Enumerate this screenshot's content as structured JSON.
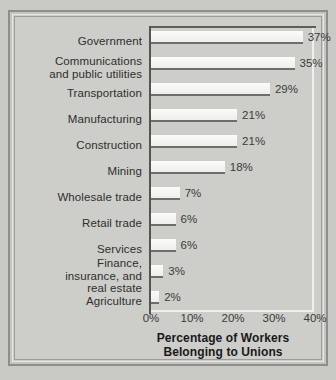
{
  "chart_data": {
    "type": "bar",
    "orientation": "horizontal",
    "title": "Percentage of Workers Belonging to Unions",
    "title_line1": "Percentage of Workers",
    "title_line2": "Belonging to Unions",
    "xlabel": "",
    "ylabel": "",
    "xlim": [
      0,
      40
    ],
    "grid": false,
    "legend": "none",
    "xticks": [
      "0%",
      "10%",
      "20%",
      "30%",
      "40%"
    ],
    "xtick_values": [
      0,
      10,
      20,
      30,
      40
    ],
    "categories": [
      "Government",
      "Communications and public utilities",
      "Transportation",
      "Manufacturing",
      "Construction",
      "Mining",
      "Wholesale trade",
      "Retail trade",
      "Services",
      "Finance, insurance, and real estate",
      "Agriculture"
    ],
    "values": [
      37,
      35,
      29,
      21,
      21,
      18,
      7,
      6,
      6,
      3,
      2
    ],
    "value_labels": [
      "37%",
      "35%",
      "29%",
      "21%",
      "21%",
      "18%",
      "7%",
      "6%",
      "6%",
      "3%",
      "2%"
    ],
    "bars": [
      {
        "label_lines": [
          "Government"
        ],
        "value": 37,
        "value_label": "37%"
      },
      {
        "label_lines": [
          "Communications",
          "and public utilities"
        ],
        "value": 35,
        "value_label": "35%"
      },
      {
        "label_lines": [
          "Transportation"
        ],
        "value": 29,
        "value_label": "29%"
      },
      {
        "label_lines": [
          "Manufacturing"
        ],
        "value": 21,
        "value_label": "21%"
      },
      {
        "label_lines": [
          "Construction"
        ],
        "value": 21,
        "value_label": "21%"
      },
      {
        "label_lines": [
          "Mining"
        ],
        "value": 18,
        "value_label": "18%"
      },
      {
        "label_lines": [
          "Wholesale trade"
        ],
        "value": 7,
        "value_label": "7%"
      },
      {
        "label_lines": [
          "Retail trade"
        ],
        "value": 6,
        "value_label": "6%"
      },
      {
        "label_lines": [
          "Services"
        ],
        "value": 6,
        "value_label": "6%"
      },
      {
        "label_lines": [
          "Finance,",
          "insurance, and",
          "real estate"
        ],
        "value": 3,
        "value_label": "3%"
      },
      {
        "label_lines": [
          "Agriculture"
        ],
        "value": 2,
        "value_label": "2%"
      }
    ],
    "colors": {
      "background": "#cdcdc9",
      "bar_fill": "#f7f7f5",
      "bar_edge": "#6e6e6a",
      "axis": "#55554f",
      "text": "#2f2f2d",
      "title": "#19191a",
      "frame": "#8e8e8a"
    }
  }
}
